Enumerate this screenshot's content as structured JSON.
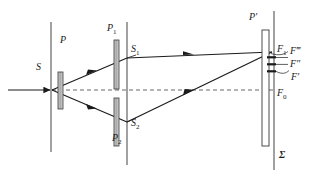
{
  "figure": {
    "type": "optics-ray-diagram",
    "background": "#ffffff",
    "ink": "#1b1b1b",
    "width": 320,
    "height": 179
  },
  "labels": {
    "source": "S",
    "polarizer_p": "P",
    "polarizer_p1": "P",
    "polarizer_p1_sub": "1",
    "polarizer_p2": "P",
    "polarizer_p2_sub": "2",
    "slit_s1": "S",
    "slit_s1_sub": "1",
    "slit_s2": "S",
    "slit_s2_sub": "2",
    "analyzer_p_prime": "P′",
    "fringe_f1": "F",
    "fringe_f1_sub": "1",
    "fringe_f_triple_prime": "F‴",
    "fringe_f_double_prime": "F″",
    "fringe_f_prime": "F′",
    "fringe_f0": "F",
    "fringe_f0_sub": "0",
    "screen_sigma": "Σ"
  },
  "elements": {
    "incoming_beam": {
      "name": "incident light ray",
      "from_x": 8,
      "to_x": 52,
      "y": 90
    },
    "source_screen": {
      "x": 51,
      "y_top": 22,
      "y_bottom": 152
    },
    "slit_screen": {
      "x": 127,
      "y_top": 22,
      "y_bottom": 165
    },
    "observation_screen": {
      "x": 274,
      "y_top": 11,
      "y_bottom": 170
    },
    "plate_p": {
      "x": 58,
      "y_top": 72,
      "y_bottom": 109,
      "width": 5
    },
    "plate_p1": {
      "x": 114,
      "y_top": 40,
      "y_bottom": 89,
      "width": 5
    },
    "plate_p2": {
      "x": 114,
      "y_top": 98,
      "y_bottom": 146,
      "width": 5
    },
    "plate_p_prime": {
      "x": 262,
      "y_top": 30,
      "y_bottom": 146,
      "width": 7
    },
    "point_s": {
      "x": 52,
      "y": 90
    },
    "point_s1": {
      "x": 127,
      "y": 58
    },
    "point_s2": {
      "x": 127,
      "y": 122
    },
    "point_f1": {
      "x": 272,
      "y": 52
    },
    "point_f0": {
      "x": 272,
      "y": 90
    },
    "optical_axis": {
      "from_x": 52,
      "to_x": 274,
      "y": 90,
      "style": "dashed"
    },
    "fringe_marks": [
      {
        "label": "F‴",
        "y": 57
      },
      {
        "label": "F″",
        "y": 64
      },
      {
        "label": "F′",
        "y": 71
      }
    ]
  },
  "colors": {
    "ink": "#1b1b1b",
    "ray": "#2a2a2a",
    "plate_fill": "#b9b9b9",
    "plate_stroke": "#3a3a3a",
    "screen_line": "#6b6b6b",
    "dashed": "#555555"
  }
}
